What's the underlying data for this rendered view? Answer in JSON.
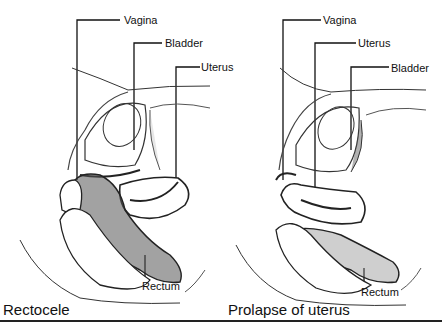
{
  "diagram": {
    "panels": [
      {
        "caption": "Rectocele",
        "labels": {
          "vagina": "Vagina",
          "bladder": "Bladder",
          "uterus": "Uterus",
          "rectum": "Rectum"
        }
      },
      {
        "caption": "Prolapse of uterus",
        "labels": {
          "vagina": "Vagina",
          "uterus": "Uterus",
          "bladder": "Bladder",
          "rectum": "Rectum"
        }
      }
    ]
  }
}
